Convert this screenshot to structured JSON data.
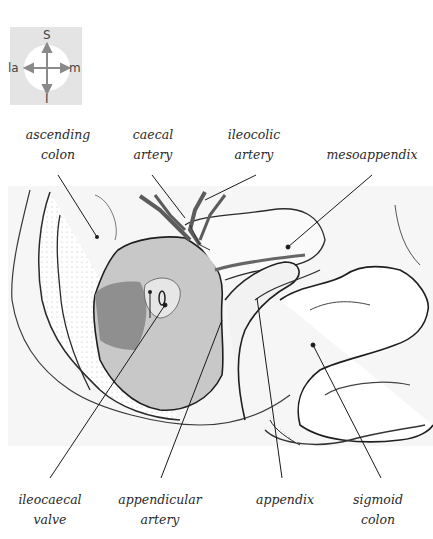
{
  "figure": {
    "compass": {
      "top": "S",
      "bottom": "I",
      "left": "la",
      "right": "m"
    },
    "labels_top": [
      {
        "id": "ascending-colon",
        "line1": "ascending",
        "line2": "colon"
      },
      {
        "id": "caecal-artery",
        "line1": "caecal",
        "line2": "artery"
      },
      {
        "id": "ileocolic-artery",
        "line1": "ileocolic",
        "line2": "artery"
      },
      {
        "id": "mesoappendix",
        "line1": "mesoappendix",
        "line2": ""
      }
    ],
    "labels_bottom": [
      {
        "id": "ileocaecal-valve",
        "line1": "ileocaecal",
        "line2": "valve"
      },
      {
        "id": "appendicular-artery",
        "line1": "appendicular",
        "line2": "artery"
      },
      {
        "id": "appendix",
        "line1": "appendix",
        "line2": ""
      },
      {
        "id": "sigmoid-colon",
        "line1": "sigmoid",
        "line2": "colon"
      }
    ],
    "colors": {
      "ink": "#2a2a2a",
      "caecum_fill": "#bdbdbd",
      "caecum_dark": "#8a8a8a",
      "artery": "#5c5c5c",
      "compass_bg": "#e4e4e4"
    }
  }
}
